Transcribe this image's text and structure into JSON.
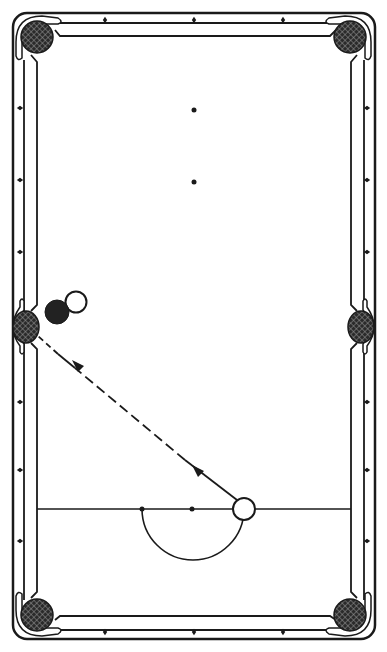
{
  "diagram": {
    "colors": {
      "background": "#ffffff",
      "ink": "#1a1a1a",
      "pocket_fill": "#2a2a2a",
      "object_ball": "#222222",
      "cue_ball": "#ffffff"
    },
    "table": {
      "pockets": [
        {
          "id": "top-left",
          "type": "corner"
        },
        {
          "id": "top-right",
          "type": "corner"
        },
        {
          "id": "middle-left",
          "type": "side"
        },
        {
          "id": "middle-right",
          "type": "side"
        },
        {
          "id": "bottom-left",
          "type": "corner"
        },
        {
          "id": "bottom-right",
          "type": "corner"
        }
      ],
      "diamonds_per_short_rail": 3,
      "diamonds_per_long_rail_half": 3,
      "spots": [
        "foot-spot",
        "center-spot",
        "head-spot"
      ],
      "head_string": true,
      "d_semicircle": true
    },
    "balls": [
      {
        "id": "object-ball",
        "color": "black",
        "near": "middle-left pocket"
      },
      {
        "id": "ghost-ball",
        "color": "outline",
        "near": "object ball"
      },
      {
        "id": "cue-ball",
        "color": "white",
        "on": "head string"
      }
    ],
    "shot": {
      "from": "cue-ball",
      "to": "middle-left pocket",
      "line_style": "solid-then-dashed",
      "arrows": 2,
      "direction": "toward pocket"
    }
  }
}
